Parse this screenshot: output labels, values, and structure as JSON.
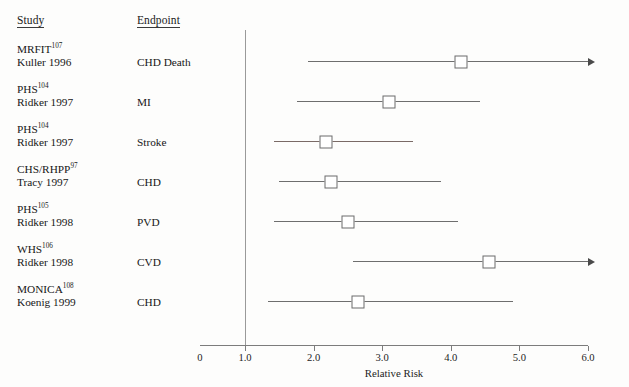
{
  "figure": {
    "width": 629,
    "height": 387,
    "background": "#fdfdfc"
  },
  "columns": {
    "study_header": "Study",
    "endpoint_header": "Endpoint"
  },
  "chart_data": {
    "type": "forest",
    "title": "",
    "xlabel": "Relative Risk",
    "ylabel": "",
    "xlim": [
      0.35,
      6.0
    ],
    "reference_line": 1.0,
    "grid": false,
    "legend": "none",
    "tick_labels": [
      "0",
      "1.0",
      "2.0",
      "3.0",
      "4.0",
      "5.0",
      "6.0"
    ],
    "tick_values": [
      0.35,
      1.0,
      2.0,
      3.0,
      4.0,
      5.0,
      6.0
    ],
    "effect_measure": "Relative Risk",
    "rows": [
      {
        "study": "MRFIT",
        "reference": "107",
        "author_year": "Kuller 1996",
        "endpoint": "CHD Death",
        "lower": 1.92,
        "estimate": 4.15,
        "upper": 6.1,
        "upper_truncated": true,
        "tinted": false
      },
      {
        "study": "PHS",
        "reference": "104",
        "author_year": "Ridker 1997",
        "endpoint": "MI",
        "lower": 1.76,
        "estimate": 3.1,
        "upper": 4.42,
        "upper_truncated": false,
        "tinted": false
      },
      {
        "study": "PHS",
        "reference": "104",
        "author_year": "Ridker 1997",
        "endpoint": "Stroke",
        "lower": 1.42,
        "estimate": 2.18,
        "upper": 3.45,
        "upper_truncated": false,
        "tinted": true
      },
      {
        "study": "CHS/RHPP",
        "reference": "97",
        "author_year": "Tracy 1997",
        "endpoint": "CHD",
        "lower": 1.5,
        "estimate": 2.25,
        "upper": 3.85,
        "upper_truncated": false,
        "tinted": false
      },
      {
        "study": "PHS",
        "reference": "105",
        "author_year": "Ridker 1998",
        "endpoint": "PVD",
        "lower": 1.42,
        "estimate": 2.5,
        "upper": 4.1,
        "upper_truncated": false,
        "tinted": false
      },
      {
        "study": "WHS",
        "reference": "106",
        "author_year": "Ridker 1998",
        "endpoint": "CVD",
        "lower": 2.58,
        "estimate": 4.55,
        "upper": 6.1,
        "upper_truncated": true,
        "tinted": false
      },
      {
        "study": "MONICA",
        "reference": "108",
        "author_year": "Koenig 1999",
        "endpoint": "CHD",
        "lower": 1.33,
        "estimate": 2.65,
        "upper": 4.9,
        "upper_truncated": false,
        "tinted": false
      }
    ]
  },
  "colors": {
    "box_fill": "#ffffff",
    "box_stroke": "#6b6b6b",
    "whisker": "#6e6e6e",
    "whisker_tinted": "#7a6a66",
    "axis": "#7c7c7c",
    "reference_line": "#9a9a9a",
    "text": "#171717"
  }
}
